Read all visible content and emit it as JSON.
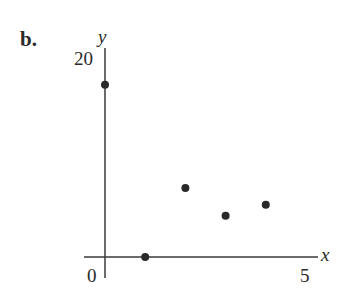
{
  "panel_label": "b.",
  "axes": {
    "x_letter": "x",
    "y_letter": "y",
    "origin_label": "0",
    "x_tick_label": "5",
    "y_tick_label": "20"
  },
  "colors": {
    "ink": "#2a2a2a",
    "background": "#ffffff"
  },
  "chart_data": {
    "type": "scatter",
    "title": "",
    "xlabel": "x",
    "ylabel": "y",
    "x": [
      0,
      1,
      2,
      3,
      4
    ],
    "y": [
      17.5,
      0,
      7,
      4.2,
      5.3
    ],
    "xlim": [
      0,
      5
    ],
    "ylim": [
      0,
      20
    ],
    "x_ticks": [
      0,
      5
    ],
    "y_ticks": [
      20
    ],
    "grid": false,
    "legend": null
  }
}
